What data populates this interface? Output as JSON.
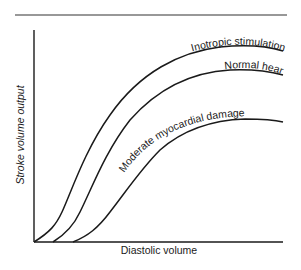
{
  "diagram": {
    "title": "",
    "xlabel": "Diastolic volume",
    "ylabel": "Stroke volume output",
    "curves": [
      {
        "name": "inotropic-stimulation",
        "label": "Inotropic stimulation"
      },
      {
        "name": "normal-heart",
        "label": "Normal heart"
      },
      {
        "name": "moderate-myocardial-damage",
        "label": "Moderate myocardial damage"
      }
    ],
    "colors": {
      "line": "#1a1a1a",
      "background": "#ffffff"
    }
  }
}
